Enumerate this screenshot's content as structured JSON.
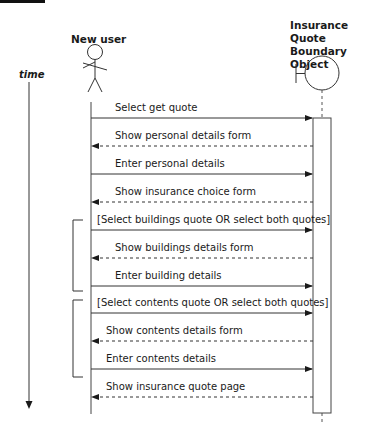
{
  "diagram": {
    "type": "sequence-diagram",
    "time_label": "time",
    "actor": {
      "name": "New user"
    },
    "boundary_object": {
      "name_lines": [
        "Insurance",
        "Quote Boundary",
        "Object"
      ]
    },
    "messages": [
      {
        "label": "Select get quote",
        "direction": "to-object",
        "style": "solid"
      },
      {
        "label": "Show personal details form",
        "direction": "to-actor",
        "style": "dashed"
      },
      {
        "label": "Enter personal details",
        "direction": "to-object",
        "style": "solid"
      },
      {
        "label": "Show insurance choice form",
        "direction": "to-actor",
        "style": "dashed"
      },
      {
        "label": "[Select buildings quote OR select both quotes]",
        "direction": "to-object",
        "style": "solid"
      },
      {
        "label": "Show buildings details form",
        "direction": "to-actor",
        "style": "dashed"
      },
      {
        "label": "Enter building details",
        "direction": "to-object",
        "style": "solid"
      },
      {
        "label": "[Select contents quote OR select both quotes]",
        "direction": "to-object",
        "style": "solid"
      },
      {
        "label": "Show contents details form",
        "direction": "to-actor",
        "style": "dashed"
      },
      {
        "label": "Enter contents details",
        "direction": "to-object",
        "style": "solid"
      },
      {
        "label": "Show insurance quote page",
        "direction": "to-actor",
        "style": "dashed"
      }
    ],
    "fragments": [
      {
        "name": "buildings-quote-fragment",
        "from_message": 4,
        "to_message": 6
      },
      {
        "name": "contents-quote-fragment",
        "from_message": 7,
        "to_message": 9
      }
    ]
  }
}
